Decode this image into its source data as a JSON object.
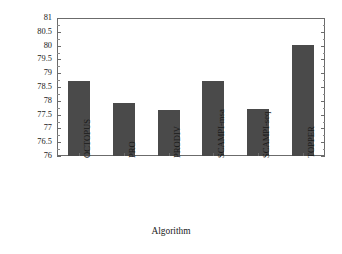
{
  "chart_data": {
    "type": "bar",
    "title": "",
    "xlabel": "Algorithm",
    "ylabel": "Prediction accuracy of residue",
    "categories": [
      "OCTOPUS",
      "PRO",
      "PRODIV",
      "SCAMPI-msa",
      "SCAMPI-seq",
      "TOPPER"
    ],
    "values": [
      78.7,
      77.93,
      77.65,
      78.72,
      77.69,
      80.02
    ],
    "ylim": [
      76,
      81
    ],
    "ytick_labels": [
      "81",
      "80.5",
      "80",
      "79.5",
      "79",
      "78.5",
      "78",
      "77.5",
      "77",
      "76.5",
      "76"
    ],
    "ytick_values": [
      81,
      80.5,
      80,
      79.5,
      79,
      78.5,
      78,
      77.5,
      77,
      76.5,
      76
    ],
    "ytick_step": 0.5,
    "grid": false,
    "legend": "none",
    "bar_color": "#4a4a4a",
    "frame_color": "#6b6b6b",
    "background_color": "#ffffff"
  }
}
